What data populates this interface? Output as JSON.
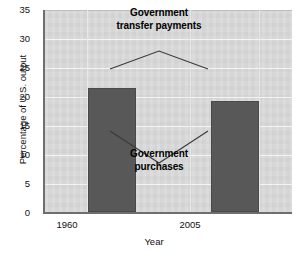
{
  "chart_data": {
    "type": "bar",
    "title": "",
    "categories": [
      "1960",
      "2005"
    ],
    "values": [
      21.5,
      19.2
    ],
    "series": [
      {
        "name": "Government transfer payments",
        "values": [
          25.5,
          25.5
        ],
        "note": "upper segment annotated by leader lines (not drawn as bars)"
      },
      {
        "name": "Government purchases",
        "values": [
          21.5,
          19.2
        ],
        "note": "dark grey bars"
      }
    ],
    "xlabel": "Year",
    "ylabel": "Percentage of U.S. output",
    "ylim": [
      0,
      35
    ],
    "yticks": [
      0,
      5,
      10,
      15,
      20,
      25,
      30,
      35
    ],
    "ytick_labels": [
      "0",
      "5",
      "10",
      "15",
      "20",
      "25",
      "30",
      "35"
    ],
    "grid": true,
    "legend": "none",
    "annotations": [
      {
        "name": "government-transfer-payments",
        "line1": "Government",
        "line2": "transfer payments",
        "points_to": [
          "1960",
          "2005"
        ]
      },
      {
        "name": "government-purchases",
        "line1": "Government",
        "line2": "purchases",
        "points_to": [
          "1960",
          "2005"
        ]
      }
    ],
    "colors": {
      "bar": "#585858",
      "panel": "#d9d9d9",
      "gridline": "#f4f4f4",
      "axis": "#6e6e6e",
      "text": "#111111"
    }
  },
  "axes": {
    "y_title": "Percentage of U.S. output",
    "x_title": "Year",
    "y_ticks": [
      "35",
      "30",
      "25",
      "20",
      "15",
      "10",
      "5",
      "0"
    ],
    "x_ticks": [
      "1960",
      "2005"
    ]
  },
  "annotations": {
    "transfer": {
      "line1": "Government",
      "line2": "transfer payments"
    },
    "purchases": {
      "line1": "Government",
      "line2": "purchases"
    }
  }
}
